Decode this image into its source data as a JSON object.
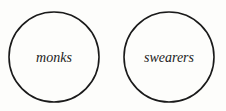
{
  "diagram": {
    "type": "euler",
    "sets": [
      {
        "label": "monks",
        "cx": 54,
        "cy": 57,
        "r": 45
      },
      {
        "label": "swearers",
        "cx": 169,
        "cy": 57,
        "r": 45
      }
    ],
    "colors": {
      "stroke": "#1a1a1a",
      "background": "#fdfdfb"
    }
  }
}
